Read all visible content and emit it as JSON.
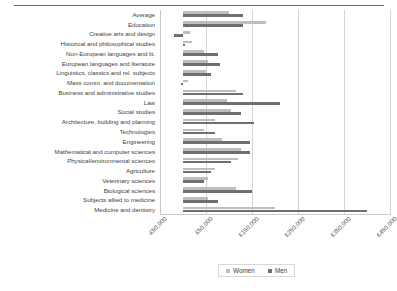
{
  "figure": {
    "has_top_rule": true
  },
  "legend": {
    "position": "bottom",
    "items": [
      {
        "label": "Women",
        "color": "#bdbdbd",
        "swatch_name": "legend-swatch-women"
      },
      {
        "label": "Men",
        "color": "#6f6f6f",
        "swatch_name": "legend-swatch-men"
      }
    ]
  },
  "axis": {
    "tick_labels": [
      "-£50,000",
      "£50,000",
      "£150,000",
      "£250,000",
      "£350,000",
      "£450,000"
    ],
    "tick_values": [
      -50000,
      50000,
      150000,
      250000,
      350000,
      450000
    ]
  },
  "chart_data": {
    "type": "bar",
    "orientation": "horizontal",
    "title": "",
    "subtitle": "",
    "xlabel": "",
    "ylabel": "",
    "xlim": [
      -50000,
      450000
    ],
    "grid": true,
    "legend_position": "bottom",
    "categories": [
      "Average",
      "Education",
      "Creative arts and design",
      "Historical and philosophical studies",
      "Non-European languages and lit.",
      "European languages and literature",
      "Linguistics, classics and rel. subjects",
      "Mass comm. and documentation",
      "Business and administrative studies",
      "Law",
      "Social studies",
      "Architecture, building and planning",
      "Technologies",
      "Engineering",
      "Mathematical and computer sciences",
      "Physical/environmental sciences",
      "Agriculture",
      "Veterinary sciences",
      "Biological sciences",
      "Subjects allied to medicine",
      "Medicine and dentistry"
    ],
    "series": [
      {
        "name": "Women",
        "color": "#bdbdbd",
        "values": [
          100000,
          180000,
          15000,
          20000,
          45000,
          55000,
          50000,
          10000,
          115000,
          95000,
          105000,
          70000,
          45000,
          85000,
          125000,
          120000,
          70000,
          55000,
          115000,
          55000,
          200000
        ]
      },
      {
        "name": "Men",
        "color": "#6f6f6f",
        "values": [
          130000,
          130000,
          -20000,
          5000,
          75000,
          80000,
          60000,
          -5000,
          130000,
          210000,
          125000,
          155000,
          70000,
          145000,
          145000,
          105000,
          60000,
          45000,
          150000,
          75000,
          400000
        ]
      }
    ]
  }
}
